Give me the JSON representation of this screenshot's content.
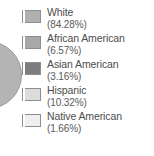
{
  "chart_data": {
    "type": "pie",
    "title": "",
    "xlabel": "",
    "ylabel": "",
    "legend_position": "right",
    "grid": false,
    "categories": [
      "White",
      "African American",
      "Asian American",
      "Hispanic",
      "Native American"
    ],
    "values": [
      84.28,
      6.57,
      3.16,
      10.32,
      1.66
    ],
    "value_labels": [
      "(84.28%)",
      "(6.57%)",
      "(3.16%)",
      "(10.32%)",
      "(1.66%)"
    ],
    "slice_colors": [
      "#b0b0b0",
      "#a8a8a8",
      "#7d7d7d",
      "#dcdcdc",
      "#efefef"
    ],
    "legend": [
      {
        "label": "White",
        "value": "(84.28%)",
        "swatch": "#b0b0b0"
      },
      {
        "label": "African American",
        "value": "(6.57%)",
        "swatch": "#a8a8a8"
      },
      {
        "label": "Asian American",
        "value": "(3.16%)",
        "swatch": "#7d7d7d"
      },
      {
        "label": "Hispanic",
        "value": "(10.32%)",
        "swatch": "#dcdcdc"
      },
      {
        "label": "Native American",
        "value": "(1.66%)",
        "swatch": "#efefef"
      }
    ]
  },
  "colors": {
    "background": "#ffffff",
    "text": "#4d4d4d",
    "swatch_border": "#8e8e8e",
    "pie_fill": "#b4b4b4",
    "pie_border": "#9a9a9a"
  }
}
